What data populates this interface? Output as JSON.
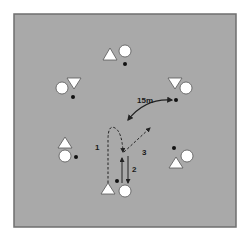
{
  "diagram": {
    "type": "drill",
    "colors": {
      "field": "#a9a9a9",
      "field_border": "#6f6f6f",
      "player_fill": "#ffffff",
      "player_stroke": "#555555",
      "ball": "#111111",
      "line": "#222222"
    },
    "labels": {
      "distance": "15m",
      "run_1": "1",
      "run_2": "2",
      "run_3": "3"
    },
    "groups": [
      {
        "name": "top",
        "triangle": "up",
        "ball": true
      },
      {
        "name": "upper-left",
        "triangle": "down",
        "ball": true
      },
      {
        "name": "upper-right",
        "triangle": "down",
        "ball": true
      },
      {
        "name": "lower-left",
        "triangle": "up",
        "ball": true
      },
      {
        "name": "lower-right",
        "triangle": "up",
        "ball": true
      },
      {
        "name": "bottom-center",
        "triangle": "up",
        "ball": true
      }
    ]
  }
}
